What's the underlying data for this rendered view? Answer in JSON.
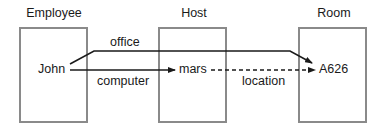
{
  "diagram": {
    "columns": [
      {
        "title": "Employee"
      },
      {
        "title": "Host"
      },
      {
        "title": "Room"
      }
    ],
    "nodes": {
      "john": "John",
      "mars": "mars",
      "a626": "A626"
    },
    "edges": {
      "office": "office",
      "computer": "computer",
      "location": "location"
    }
  }
}
